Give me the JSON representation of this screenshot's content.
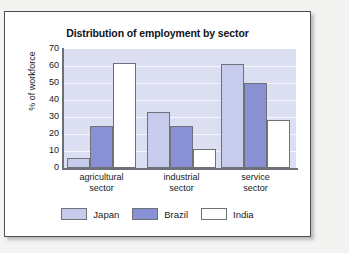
{
  "chart_data": {
    "type": "bar",
    "title": "Distribution of employment by sector",
    "xlabel": "",
    "ylabel": "% of workforce",
    "ylim": [
      0,
      70
    ],
    "ytick_labels": [
      "70",
      "60",
      "50",
      "40",
      "30",
      "20",
      "10",
      "0"
    ],
    "ytick_values": [
      70,
      60,
      50,
      40,
      30,
      20,
      10,
      0
    ],
    "grid": true,
    "legend_position": "bottom",
    "categories": [
      "agricultural sector",
      "industrial sector",
      "service sector"
    ],
    "category_lines": [
      [
        "agricultural",
        "sector"
      ],
      [
        "industrial",
        "sector"
      ],
      [
        "service",
        "sector"
      ]
    ],
    "series": [
      {
        "name": "Japan",
        "color": "#c7ccec",
        "values": [
          6,
          33,
          61
        ]
      },
      {
        "name": "Brazil",
        "color": "#8a90d4",
        "values": [
          25,
          25,
          50
        ]
      },
      {
        "name": "India",
        "color": "#ffffff",
        "values": [
          62,
          11,
          28
        ]
      }
    ]
  },
  "legend": {
    "items": [
      {
        "label": "Japan"
      },
      {
        "label": "Brazil"
      },
      {
        "label": "India"
      }
    ]
  },
  "colors": {
    "plot_background": "#dcdff2",
    "axis": "#6d7076",
    "bar_border": "#6e7178",
    "frame_border": "#4a4f56",
    "text": "#16191d"
  }
}
